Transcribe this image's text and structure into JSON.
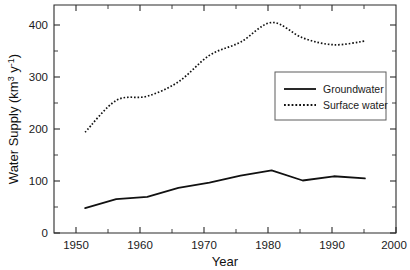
{
  "chart_data": {
    "type": "line",
    "title": "",
    "xlabel": "Year",
    "ylabel": "Water Supply (km3 y-1)",
    "ylabel_parts": {
      "main": "Water Supply (km",
      "sup1": "3",
      "mid": " y",
      "sup2": "-1",
      "tail": ")"
    },
    "x": [
      1950,
      1955,
      1960,
      1965,
      1970,
      1975,
      1980,
      1985,
      1990,
      1995
    ],
    "xlim": [
      1945,
      2000
    ],
    "ylim": [
      0,
      430
    ],
    "xticks": [
      1950,
      1960,
      1970,
      1980,
      1990,
      2000
    ],
    "xticklabels": [
      "1950",
      "1960",
      "1970",
      "1980",
      "1990",
      "2000"
    ],
    "xminorticks": [
      1955,
      1965,
      1975,
      1985,
      1995
    ],
    "yticks": [
      0,
      100,
      200,
      300,
      400
    ],
    "yticklabels": [
      "0",
      "100",
      "200",
      "300",
      "400"
    ],
    "yminorticks": [
      50,
      150,
      250,
      350
    ],
    "grid": false,
    "legend_position": "center-right",
    "series": [
      {
        "name": "Groundwater",
        "style": "solid",
        "color": "#111111",
        "values": [
          47,
          64,
          68,
          85,
          95,
          108,
          118,
          99,
          107,
          103
        ]
      },
      {
        "name": "Surface water",
        "style": "dotted",
        "color": "#111111",
        "values": [
          190,
          250,
          258,
          285,
          335,
          360,
          397,
          368,
          355,
          362
        ]
      }
    ]
  },
  "legend": {
    "items": [
      {
        "label": "Groundwater",
        "style": "solid"
      },
      {
        "label": "Surface water",
        "style": "dotted"
      }
    ]
  }
}
